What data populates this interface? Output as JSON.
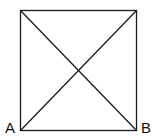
{
  "diagram": {
    "type": "square-with-diagonals",
    "labels": {
      "bottom_left": "A",
      "bottom_right": "B"
    },
    "colors": {
      "stroke": "#1a1a1a",
      "background": "#ffffff"
    }
  }
}
